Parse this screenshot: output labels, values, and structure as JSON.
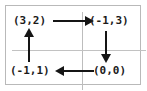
{
  "diagram": {
    "type": "cycle-diagram",
    "grid": {
      "rows": 2,
      "columns": 2,
      "border_color": "#b9b9b9",
      "gridline_color": "#bdbdbd",
      "background_color": "#ffffff"
    },
    "text_color": "#1b1b1b",
    "arrow_color": "#151515",
    "nodes": [
      {
        "id": "top-left",
        "label": "(3,2)",
        "cell": "row1-col1"
      },
      {
        "id": "top-right",
        "label": "(-1,3)",
        "cell": "row1-col2"
      },
      {
        "id": "bottom-left",
        "label": "(-1,1)",
        "cell": "row2-col1"
      },
      {
        "id": "bottom-right",
        "label": "(0,0)",
        "cell": "row2-col2"
      }
    ],
    "arrows": [
      {
        "id": "top",
        "from": "top-left",
        "to": "top-right",
        "direction": "right"
      },
      {
        "id": "right",
        "from": "top-right",
        "to": "bottom-right",
        "direction": "down"
      },
      {
        "id": "bottom",
        "from": "bottom-right",
        "to": "bottom-left",
        "direction": "left"
      },
      {
        "id": "left",
        "from": "bottom-left",
        "to": "top-left",
        "direction": "up"
      }
    ]
  }
}
